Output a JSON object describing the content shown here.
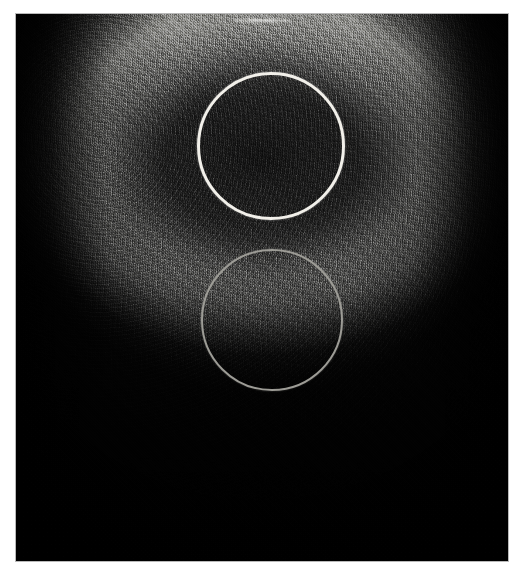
{
  "figure": {
    "kind": "medical-ultrasound-scan",
    "modality_label": "B-mode ultrasound / high-frequency scan",
    "orientation": "transverse",
    "frame": {
      "x": 16,
      "y": 14,
      "width": 492,
      "height": 547,
      "background_hex": "#060606",
      "border_hex": "#b9b9b9"
    },
    "anatomy": {
      "description": "Bright convex superficial capsule arc over a dark hypoechoic parenchymal body tapering downward into acoustic shadow",
      "bright_dome_label": "superficial echogenic capsule",
      "dark_core_label": "hypoechoic parenchyma",
      "shadow_label": "posterior acoustic shadowing"
    },
    "colors": {
      "page_background": "#ffffff",
      "scan_black": "#050505",
      "dome_bright": "#d0d0cd",
      "dome_mid": "#8a8a87",
      "tissue_mid": "#3a3a3a",
      "roi_upper_stroke": "#f2f0ea",
      "roi_lower_stroke": "#9d9c96",
      "apex_specular": "#ffffff",
      "caption_ink": "#cfcfcf"
    },
    "annotations": [
      {
        "id": "roi-upper",
        "name": "upper-region-of-interest",
        "shape": "circle",
        "center_x": 271,
        "center_y": 146,
        "radius": 74,
        "stroke_hex": "#f2f0ea",
        "stroke_width": 3,
        "brightness": "bright-white",
        "region": "upper hyperechoic / sampled tissue zone"
      },
      {
        "id": "roi-lower",
        "name": "lower-region-of-interest",
        "shape": "circle",
        "center_x": 272,
        "center_y": 320,
        "radius": 71,
        "stroke_hex": "#9d9c96",
        "stroke_width": 2.5,
        "brightness": "dim-gray",
        "region": "deeper hypoechoic / reference zone"
      }
    ],
    "caption": {
      "text": "clipped caption line at lower page margin",
      "visible": false,
      "clipped": true
    }
  }
}
